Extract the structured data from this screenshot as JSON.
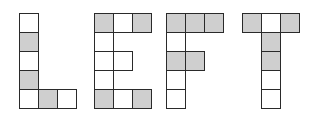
{
  "colors": {
    "shaded": "#cfcfcf",
    "empty": "#ffffff",
    "border": "#2a2a2a"
  },
  "grid": {
    "cell_size": 19,
    "rows": 5
  },
  "letters": [
    {
      "char": "L",
      "x": 19,
      "y": 13,
      "cells": [
        {
          "col": 0,
          "row": 0,
          "shaded": false
        },
        {
          "col": 0,
          "row": 1,
          "shaded": true
        },
        {
          "col": 0,
          "row": 2,
          "shaded": false
        },
        {
          "col": 0,
          "row": 3,
          "shaded": true
        },
        {
          "col": 0,
          "row": 4,
          "shaded": false
        },
        {
          "col": 1,
          "row": 4,
          "shaded": true
        },
        {
          "col": 2,
          "row": 4,
          "shaded": false
        }
      ]
    },
    {
      "char": "E",
      "x": 94,
      "y": 13,
      "cells": [
        {
          "col": 0,
          "row": 0,
          "shaded": true
        },
        {
          "col": 1,
          "row": 0,
          "shaded": false
        },
        {
          "col": 2,
          "row": 0,
          "shaded": true
        },
        {
          "col": 0,
          "row": 1,
          "shaded": false
        },
        {
          "col": 0,
          "row": 2,
          "shaded": false
        },
        {
          "col": 1,
          "row": 2,
          "shaded": false
        },
        {
          "col": 0,
          "row": 3,
          "shaded": false
        },
        {
          "col": 0,
          "row": 4,
          "shaded": true
        },
        {
          "col": 1,
          "row": 4,
          "shaded": false
        },
        {
          "col": 2,
          "row": 4,
          "shaded": true
        }
      ]
    },
    {
      "char": "F",
      "x": 166,
      "y": 13,
      "cells": [
        {
          "col": 0,
          "row": 0,
          "shaded": true
        },
        {
          "col": 1,
          "row": 0,
          "shaded": true
        },
        {
          "col": 2,
          "row": 0,
          "shaded": true
        },
        {
          "col": 0,
          "row": 1,
          "shaded": false
        },
        {
          "col": 0,
          "row": 2,
          "shaded": true
        },
        {
          "col": 1,
          "row": 2,
          "shaded": true
        },
        {
          "col": 0,
          "row": 3,
          "shaded": false
        },
        {
          "col": 0,
          "row": 4,
          "shaded": false
        }
      ]
    },
    {
      "char": "T",
      "x": 242,
      "y": 13,
      "cells": [
        {
          "col": 0,
          "row": 0,
          "shaded": true
        },
        {
          "col": 1,
          "row": 0,
          "shaded": false
        },
        {
          "col": 2,
          "row": 0,
          "shaded": true
        },
        {
          "col": 1,
          "row": 1,
          "shaded": true
        },
        {
          "col": 1,
          "row": 2,
          "shaded": true
        },
        {
          "col": 1,
          "row": 3,
          "shaded": false
        },
        {
          "col": 1,
          "row": 4,
          "shaded": false
        }
      ]
    }
  ]
}
